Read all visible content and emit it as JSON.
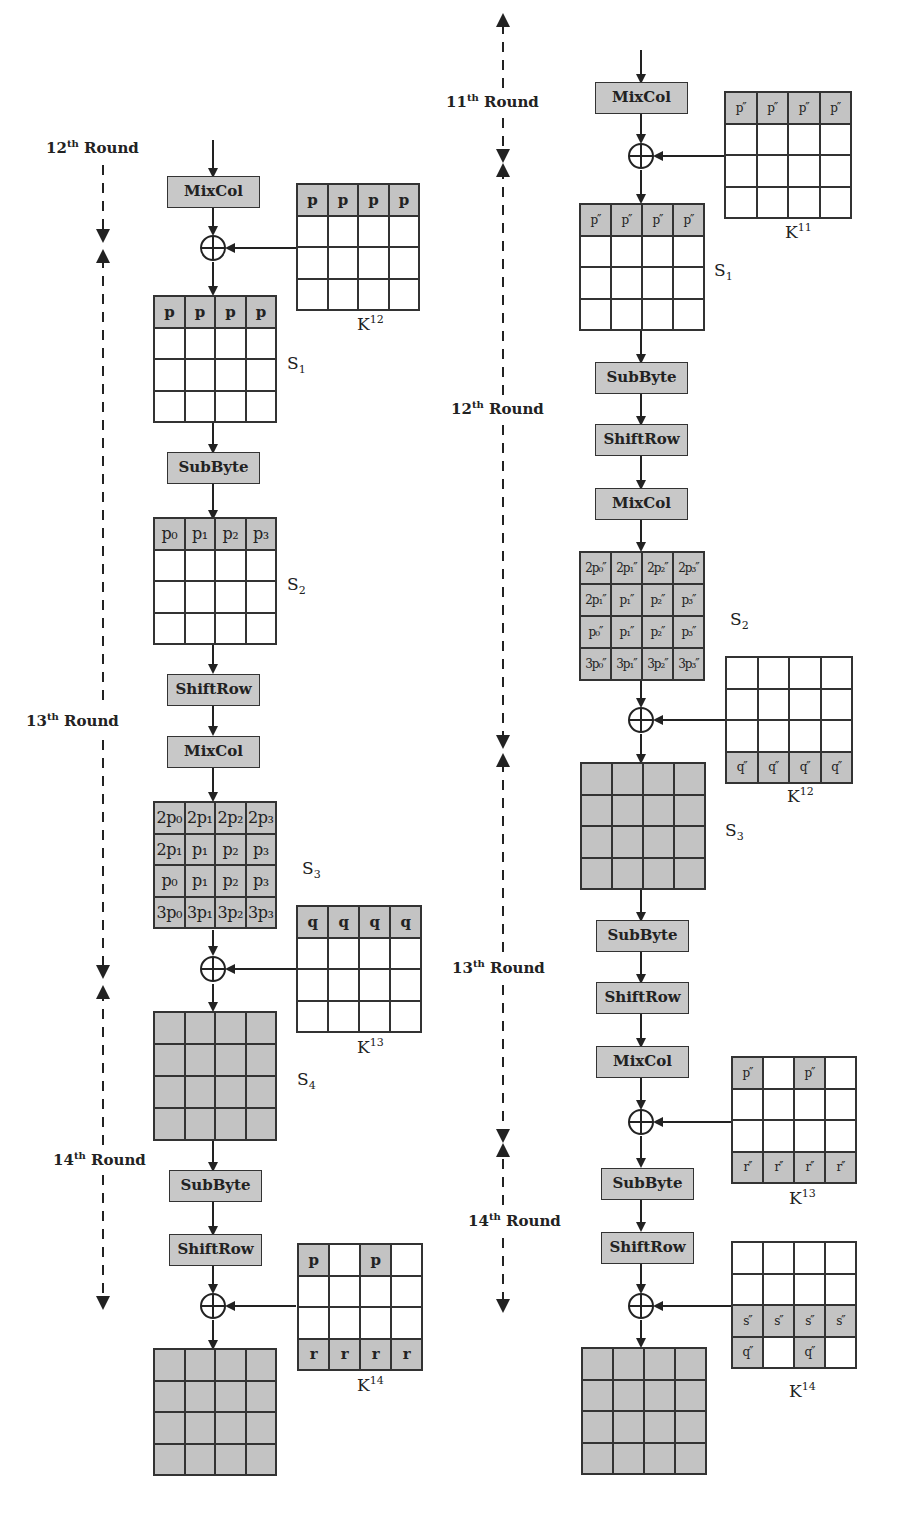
{
  "left": {
    "rounds": [
      {
        "num": "12",
        "sup": "th",
        "word": "Round"
      },
      {
        "num": "13",
        "sup": "th",
        "word": "Round"
      },
      {
        "num": "14",
        "sup": "th",
        "word": "Round"
      }
    ],
    "ops": [
      "MixCol",
      "SubByte",
      "ShiftRow",
      "MixCol",
      "SubByte",
      "ShiftRow"
    ],
    "states": [
      {
        "name": "S",
        "sub": "1",
        "cells": [
          [
            "p",
            "p",
            "p",
            "p"
          ],
          [
            "",
            "",
            "",
            ""
          ],
          [
            "",
            "",
            "",
            ""
          ],
          [
            "",
            "",
            "",
            ""
          ]
        ]
      },
      {
        "name": "S",
        "sub": "2",
        "cells": [
          [
            "p₀",
            "p₁",
            "p₂",
            "p₃"
          ],
          [
            "",
            "",
            "",
            ""
          ],
          [
            "",
            "",
            "",
            ""
          ],
          [
            "",
            "",
            "",
            ""
          ]
        ]
      },
      {
        "name": "S",
        "sub": "3",
        "cells": [
          [
            "2p₀",
            "2p₁",
            "2p₂",
            "2p₃"
          ],
          [
            "2p₁",
            "p₁",
            "p₂",
            "p₃"
          ],
          [
            "p₀",
            "p₁",
            "p₂",
            "p₃"
          ],
          [
            "3p₀",
            "3p₁",
            "3p₂",
            "3p₃"
          ]
        ]
      },
      {
        "name": "S",
        "sub": "4",
        "cells": [
          [
            "",
            "",
            "",
            ""
          ],
          [
            "",
            "",
            "",
            ""
          ],
          [
            "",
            "",
            "",
            ""
          ],
          [
            "",
            "",
            "",
            ""
          ]
        ]
      },
      {
        "name": "",
        "sub": "",
        "cells": [
          [
            "",
            "",
            "",
            ""
          ],
          [
            "",
            "",
            "",
            ""
          ],
          [
            "",
            "",
            "",
            ""
          ],
          [
            "",
            "",
            "",
            ""
          ]
        ]
      }
    ],
    "keys": [
      {
        "name": "K",
        "sup": "12",
        "cells": [
          [
            "p",
            "p",
            "p",
            "p"
          ],
          [
            "",
            "",
            "",
            ""
          ],
          [
            "",
            "",
            "",
            ""
          ],
          [
            "",
            "",
            "",
            ""
          ]
        ]
      },
      {
        "name": "K",
        "sup": "13",
        "cells": [
          [
            "q",
            "q",
            "q",
            "q"
          ],
          [
            "",
            "",
            "",
            ""
          ],
          [
            "",
            "",
            "",
            ""
          ],
          [
            "",
            "",
            "",
            ""
          ]
        ]
      },
      {
        "name": "K",
        "sup": "14",
        "cells": [
          [
            "p",
            "",
            "p",
            ""
          ],
          [
            "",
            "",
            "",
            ""
          ],
          [
            "",
            "",
            "",
            ""
          ],
          [
            "r",
            "r",
            "r",
            "r"
          ]
        ]
      }
    ]
  },
  "right": {
    "rounds": [
      {
        "num": "11",
        "sup": "th",
        "word": "Round"
      },
      {
        "num": "12",
        "sup": "th",
        "word": "Round"
      },
      {
        "num": "13",
        "sup": "th",
        "word": "Round"
      },
      {
        "num": "14",
        "sup": "th",
        "word": "Round"
      }
    ],
    "ops": [
      "MixCol",
      "SubByte",
      "ShiftRow",
      "MixCol",
      "SubByte",
      "ShiftRow",
      "MixCol",
      "SubByte",
      "ShiftRow"
    ],
    "states": [
      {
        "name": "S",
        "sub": "1",
        "cells": [
          [
            "p′′",
            "p′′",
            "p′′",
            "p′′"
          ],
          [
            "",
            "",
            "",
            ""
          ],
          [
            "",
            "",
            "",
            ""
          ],
          [
            "",
            "",
            "",
            ""
          ]
        ]
      },
      {
        "name": "S",
        "sub": "2",
        "cells": [
          [
            "2p₀′′",
            "2p₁′′",
            "2p₂′′",
            "2p₃′′"
          ],
          [
            "2p₁′′",
            "p₁′′",
            "p₂′′",
            "p₃′′"
          ],
          [
            "p₀′′",
            "p₁′′",
            "p₂′′",
            "p₃′′"
          ],
          [
            "3p₀′′",
            "3p₁′′",
            "3p₂′′",
            "3p₃′′"
          ]
        ]
      },
      {
        "name": "S",
        "sub": "3",
        "cells": [
          [
            "",
            "",
            "",
            ""
          ],
          [
            "",
            "",
            "",
            ""
          ],
          [
            "",
            "",
            "",
            ""
          ],
          [
            "",
            "",
            "",
            ""
          ]
        ]
      },
      {
        "name": "",
        "sub": "",
        "cells": [
          [
            "",
            "",
            "",
            ""
          ],
          [
            "",
            "",
            "",
            ""
          ],
          [
            "",
            "",
            "",
            ""
          ],
          [
            "",
            "",
            "",
            ""
          ]
        ]
      }
    ],
    "keys": [
      {
        "name": "K",
        "sup": "11",
        "cells": [
          [
            "p′′",
            "p′′",
            "p′′",
            "p′′"
          ],
          [
            "",
            "",
            "",
            ""
          ],
          [
            "",
            "",
            "",
            ""
          ],
          [
            "",
            "",
            "",
            ""
          ]
        ]
      },
      {
        "name": "K",
        "sup": "12",
        "cells": [
          [
            "",
            "",
            "",
            ""
          ],
          [
            "",
            "",
            "",
            ""
          ],
          [
            "",
            "",
            "",
            ""
          ],
          [
            "q′′",
            "q′′",
            "q′′",
            "q′′"
          ]
        ]
      },
      {
        "name": "K",
        "sup": "13",
        "cells": [
          [
            "p′′",
            "",
            "p′′",
            ""
          ],
          [
            "",
            "",
            "",
            ""
          ],
          [
            "",
            "",
            "",
            ""
          ],
          [
            "r′′",
            "r′′",
            "r′′",
            "r′′"
          ]
        ]
      },
      {
        "name": "K",
        "sup": "14",
        "cells": [
          [
            "",
            "",
            "",
            ""
          ],
          [
            "",
            "",
            "",
            ""
          ],
          [
            "s′′",
            "s′′",
            "s′′",
            "s′′"
          ],
          [
            "q′′",
            "",
            "q′′",
            ""
          ]
        ]
      }
    ]
  },
  "colors": {
    "shaded": "#c3c3c3",
    "line": "#333333",
    "background": "#ffffff"
  }
}
